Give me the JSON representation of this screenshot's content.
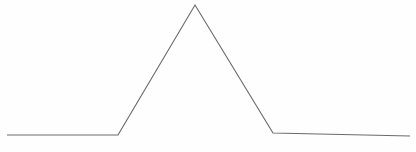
{
  "chart_data": {
    "type": "line",
    "title": "",
    "subtitle": "",
    "xlabel": "",
    "ylabel": "",
    "xlim": [
      0,
      416
    ],
    "ylim": [
      0,
      152
    ],
    "grid": false,
    "axes_visible": false,
    "tick_labels_x": [],
    "tick_labels_y": [],
    "legend": [],
    "legend_position": "none",
    "annotations": [],
    "series": [
      {
        "name": "signal",
        "color": "#6b6b6b",
        "stroke_width": 1.15,
        "points": [
          {
            "x": 7,
            "y": 135
          },
          {
            "x": 118,
            "y": 135
          },
          {
            "x": 195,
            "y": 5
          },
          {
            "x": 273,
            "y": 133
          },
          {
            "x": 410,
            "y": 136
          }
        ],
        "path": "M 7 135 L 118 135 L 195 5 L 273 133 L 410 136"
      }
    ]
  },
  "canvas": {
    "width": 416,
    "height": 152,
    "background": "#fefefe",
    "line_color": "#6b6b6b"
  }
}
